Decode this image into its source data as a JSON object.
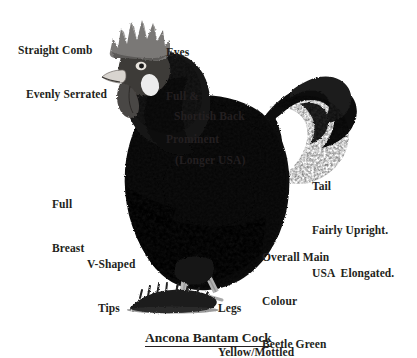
{
  "figure": {
    "title": "Ancona Bantam Cock",
    "background_color": "#ffffff",
    "text_color": "#231f20"
  },
  "annotations": [
    {
      "id": "comb",
      "name": "straight-comb",
      "lines": [
        "Straight Comb",
        "Evenly Serrated"
      ]
    },
    {
      "id": "eyes",
      "name": "eyes",
      "lines": [
        "Eyes",
        "Full &",
        "Prominent"
      ]
    },
    {
      "id": "back",
      "name": "shortish-back",
      "lines": [
        "Shortish Back",
        "(Longer USA)"
      ]
    },
    {
      "id": "tail",
      "name": "tail",
      "lines": [
        "Tail",
        "Fairly Upright.",
        "USA  Elongated."
      ]
    },
    {
      "id": "breast",
      "name": "full-breast",
      "lines": [
        "Full",
        "Breast"
      ]
    },
    {
      "id": "tips",
      "name": "v-shaped-tips",
      "lines": [
        "V-Shaped",
        "Tips"
      ]
    },
    {
      "id": "colour",
      "name": "overall-main-colour",
      "lines": [
        "Overall Main",
        "Colour",
        "Beetle Green"
      ]
    },
    {
      "id": "legs",
      "name": "legs",
      "lines": [
        "Legs",
        "Yellow/Mottled"
      ]
    }
  ],
  "annotation_text": {
    "comb_1": "Straight Comb",
    "comb_2": "Evenly Serrated",
    "eyes_1": "Eyes",
    "eyes_2": "Full &",
    "eyes_3": "Prominent",
    "back_1": "Shortish Back",
    "back_2": "(Longer USA)",
    "tail_1": "Tail",
    "tail_2": "Fairly Upright.",
    "tail_3": "USA  Elongated.",
    "breast_1": "Full",
    "breast_2": "Breast",
    "tips_1": "V-Shaped",
    "tips_2": "Tips",
    "colour_1": "Overall Main",
    "colour_2": "Colour",
    "colour_3": "Beetle Green",
    "legs_1": "Legs",
    "legs_2": "Yellow/Mottled"
  },
  "illustration": {
    "plumage_color": "#111111",
    "mottle_color": "#f2f2f2",
    "comb_color": "#6b6b6b",
    "earlobe_color": "#e8e8e8",
    "leg_color": "#b9b9b9",
    "ground_color": "#1a1a1a"
  }
}
